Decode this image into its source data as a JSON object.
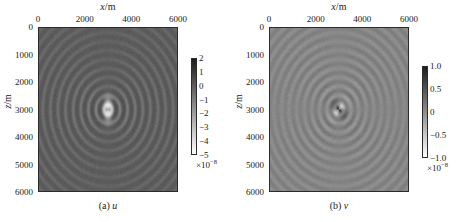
{
  "figure": {
    "panels": [
      {
        "id": "panel-a",
        "caption_index": "(a)",
        "caption_symbol": "u",
        "xlabel_var": "x",
        "xlabel_unit": "/m",
        "ylabel_var": "z",
        "ylabel_unit": "/m",
        "xticks": [
          "0",
          "2000",
          "4000",
          "6000"
        ],
        "yticks": [
          "0",
          "1000",
          "2000",
          "3000",
          "4000",
          "5000",
          "6000"
        ],
        "cbar_ticks": [
          "2",
          "1",
          "0",
          "−1",
          "−2",
          "−3",
          "−4",
          "−5"
        ],
        "cbar_exponent_base": "×10",
        "cbar_exponent_power": "−8"
      },
      {
        "id": "panel-b",
        "caption_index": "(b)",
        "caption_symbol": "v",
        "xlabel_var": "x",
        "xlabel_unit": "/m",
        "ylabel_var": "z",
        "ylabel_unit": "/m",
        "xticks": [
          "0",
          "2000",
          "4000",
          "6000"
        ],
        "yticks": [
          "0",
          "1000",
          "2000",
          "3000",
          "4000",
          "5000",
          "6000"
        ],
        "cbar_ticks": [
          "1.0",
          "0.5",
          "0",
          "−0.5",
          "−1.0"
        ],
        "cbar_exponent_base": "×10",
        "cbar_exponent_power": "−8"
      }
    ]
  },
  "chart_data": [
    {
      "type": "heatmap",
      "title": "(a) u",
      "xlabel": "x/m",
      "ylabel": "z/m",
      "xlim": [
        0,
        6000
      ],
      "ylim": [
        0,
        6000
      ],
      "y_axis_inverted": true,
      "xticks": [
        0,
        2000,
        4000,
        6000
      ],
      "yticks": [
        0,
        1000,
        2000,
        3000,
        4000,
        5000,
        6000
      ],
      "grid": false,
      "colormap": "gray_reversed",
      "colorbar": {
        "position": "right",
        "ticks": [
          2,
          1,
          0,
          -1,
          -2,
          -3,
          -4,
          -5
        ],
        "vmin": -5,
        "vmax": 2,
        "scale_factor": 1e-08,
        "exponent_label": "×10⁻⁸"
      },
      "description": "Horizontal displacement component u of a seismic wavefield snapshot. Concentric circular wavefronts radiate from a point source at approximately x = 3000 m, z = 3000 m, with a vertically elongated dark amplitude core at the source and alternating light and dark rings of decreasing amplitude outward.",
      "source_location": {
        "x": 3000,
        "z": 3000
      },
      "wavefront_ring_spacing_m": 330,
      "num_visible_rings": 9
    },
    {
      "type": "heatmap",
      "title": "(b) v",
      "xlabel": "x/m",
      "ylabel": "z/m",
      "xlim": [
        0,
        6000
      ],
      "ylim": [
        0,
        6000
      ],
      "y_axis_inverted": true,
      "xticks": [
        0,
        2000,
        4000,
        6000
      ],
      "yticks": [
        0,
        1000,
        2000,
        3000,
        4000,
        5000,
        6000
      ],
      "grid": false,
      "colormap": "gray_reversed",
      "colorbar": {
        "position": "right",
        "ticks": [
          1.0,
          0.5,
          0,
          -0.5,
          -1.0
        ],
        "vmin": -1.0,
        "vmax": 1.0,
        "scale_factor": 1e-08,
        "exponent_label": "×10⁻⁸"
      },
      "description": "Vertical displacement component v of the same seismic wavefield snapshot. Concentric circular wavefronts radiate from a point source at approximately x = 3000 m, z = 3000 m, with a four-lobed quadrupole amplitude pattern at the source center and alternating light and dark rings outward.",
      "source_location": {
        "x": 3000,
        "z": 3000
      },
      "wavefront_ring_spacing_m": 330,
      "num_visible_rings": 9
    }
  ]
}
